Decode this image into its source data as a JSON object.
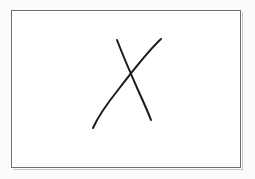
{
  "image": {
    "title": "Hand-drawn X mark on white paper",
    "width": 255,
    "height": 179,
    "background_color": "#fbfbfa",
    "paper_color": "#ffffff",
    "ink_color": "#1b1b1d",
    "frame_border_color": "#6f6f74",
    "frame_shadow_color": "#c9c9cc",
    "alt_text": "A rectangular white frame containing a hand-drawn X made of two crossing pen strokes"
  },
  "frame": {
    "name": "paper-rectangle",
    "x": 11,
    "y": 10,
    "width": 230,
    "height": 158,
    "border_width": 1
  },
  "mark": {
    "type": "x-mark",
    "label": "X",
    "stroke_count": 2,
    "crossing_point": {
      "x": 132,
      "y": 72
    },
    "strokes": [
      {
        "name": "backslash-stroke",
        "direction": "top-left-to-bottom-right",
        "start": {
          "x": 117,
          "y": 40
        },
        "end": {
          "x": 151,
          "y": 120
        },
        "path": "M117,40 C122,53 130,72 138,90 C143,101 148,112 151,120",
        "stroke_width": 2.0
      },
      {
        "name": "slash-stroke",
        "direction": "bottom-left-to-top-right",
        "start": {
          "x": 93,
          "y": 128
        },
        "end": {
          "x": 161,
          "y": 39
        },
        "path": "M93,128 C97,119 106,105 118,90 C131,73 148,51 161,39",
        "stroke_width": 2.0
      }
    ]
  }
}
